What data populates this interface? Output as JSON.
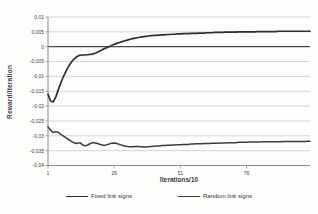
{
  "chart_data": {
    "type": "line",
    "title": "",
    "xlabel": "Iterations/10",
    "ylabel": "Reward/Iteration",
    "xlim": [
      1,
      100
    ],
    "ylim": [
      -0.04,
      0.01
    ],
    "grid": "horizontal",
    "legend_position": "bottom",
    "colors": {
      "background": "#fdfdfb",
      "gridline": "#c9c9c9",
      "axis_line": "#8c8c8c",
      "zero_line": "#4a4a4a",
      "tick_text": "#3c3c3c"
    },
    "y_ticks": [
      {
        "value": 0.01,
        "label": "0,01"
      },
      {
        "value": 0.005,
        "label": "0,005"
      },
      {
        "value": 0,
        "label": "0"
      },
      {
        "value": -0.005,
        "label": "-0,005"
      },
      {
        "value": -0.01,
        "label": "-0,01"
      },
      {
        "value": -0.015,
        "label": "-0,015"
      },
      {
        "value": -0.02,
        "label": "-0,02"
      },
      {
        "value": -0.025,
        "label": "-0,025"
      },
      {
        "value": -0.03,
        "label": "-0,03"
      },
      {
        "value": -0.035,
        "label": "-0,035"
      },
      {
        "value": -0.04,
        "label": "-0,04"
      }
    ],
    "x_ticks": [
      {
        "value": 1,
        "label": "1"
      },
      {
        "value": 26,
        "label": "26"
      },
      {
        "value": 51,
        "label": "51"
      },
      {
        "value": 76,
        "label": "76"
      }
    ],
    "series": [
      {
        "name": "Fixed link signs",
        "color": "#2e2e33",
        "stroke_width": 1.7,
        "x_start": 1,
        "x_step": 1,
        "values": [
          -0.016,
          -0.0183,
          -0.0186,
          -0.0168,
          -0.0142,
          -0.0118,
          -0.0097,
          -0.0079,
          -0.0063,
          -0.005,
          -0.004,
          -0.0033,
          -0.0029,
          -0.0028,
          -0.0028,
          -0.0027,
          -0.0026,
          -0.0024,
          -0.0021,
          -0.0017,
          -0.0013,
          -0.0008,
          -0.0004,
          0.0,
          0.0004,
          0.0008,
          0.0011,
          0.0014,
          0.0017,
          0.002,
          0.0022,
          0.0025,
          0.0027,
          0.0029,
          0.0031,
          0.0032,
          0.0034,
          0.0035,
          0.0036,
          0.0037,
          0.0038,
          0.0038,
          0.0039,
          0.004,
          0.004,
          0.0041,
          0.0041,
          0.0042,
          0.0042,
          0.0043,
          0.0043,
          0.0044,
          0.0044,
          0.0044,
          0.0045,
          0.0045,
          0.0045,
          0.0046,
          0.0046,
          0.0046,
          0.0047,
          0.0047,
          0.0047,
          0.0048,
          0.0048,
          0.0048,
          0.0048,
          0.0049,
          0.0049,
          0.0049,
          0.0049,
          0.0049,
          0.005,
          0.005,
          0.005,
          0.005,
          0.005,
          0.005,
          0.005,
          0.0051,
          0.0051,
          0.0051,
          0.0051,
          0.0051,
          0.0051,
          0.0051,
          0.0051,
          0.0052,
          0.0052,
          0.0052,
          0.0052,
          0.0052,
          0.0052,
          0.0052,
          0.0052,
          0.0052,
          0.0052,
          0.0052,
          0.0052,
          0.0052
        ]
      },
      {
        "name": "Random link signs",
        "color": "#3b3b3b",
        "stroke_width": 1.5,
        "x_start": 1,
        "x_step": 1,
        "values": [
          -0.027,
          -0.0281,
          -0.0289,
          -0.0286,
          -0.0289,
          -0.0296,
          -0.0302,
          -0.0308,
          -0.0314,
          -0.032,
          -0.0324,
          -0.0326,
          -0.0323,
          -0.033,
          -0.0334,
          -0.0331,
          -0.0326,
          -0.0323,
          -0.0324,
          -0.0327,
          -0.033,
          -0.0332,
          -0.0331,
          -0.0328,
          -0.0325,
          -0.0324,
          -0.0326,
          -0.0329,
          -0.0332,
          -0.0334,
          -0.0336,
          -0.0337,
          -0.0337,
          -0.0336,
          -0.0336,
          -0.0337,
          -0.0338,
          -0.0338,
          -0.0337,
          -0.0336,
          -0.0335,
          -0.0334,
          -0.0334,
          -0.0333,
          -0.0333,
          -0.0332,
          -0.0332,
          -0.0331,
          -0.0331,
          -0.033,
          -0.033,
          -0.0329,
          -0.0329,
          -0.0329,
          -0.0328,
          -0.0328,
          -0.0327,
          -0.0327,
          -0.0327,
          -0.0326,
          -0.0326,
          -0.0326,
          -0.0325,
          -0.0325,
          -0.0325,
          -0.0324,
          -0.0324,
          -0.0324,
          -0.0323,
          -0.0323,
          -0.0323,
          -0.0323,
          -0.0322,
          -0.0322,
          -0.0322,
          -0.0322,
          -0.0321,
          -0.0321,
          -0.0321,
          -0.0321,
          -0.0321,
          -0.032,
          -0.032,
          -0.032,
          -0.032,
          -0.032,
          -0.032,
          -0.032,
          -0.032,
          -0.0319,
          -0.0319,
          -0.0319,
          -0.0319,
          -0.0319,
          -0.0319,
          -0.0319,
          -0.0319,
          -0.0319,
          -0.0318,
          -0.0318
        ]
      }
    ]
  }
}
